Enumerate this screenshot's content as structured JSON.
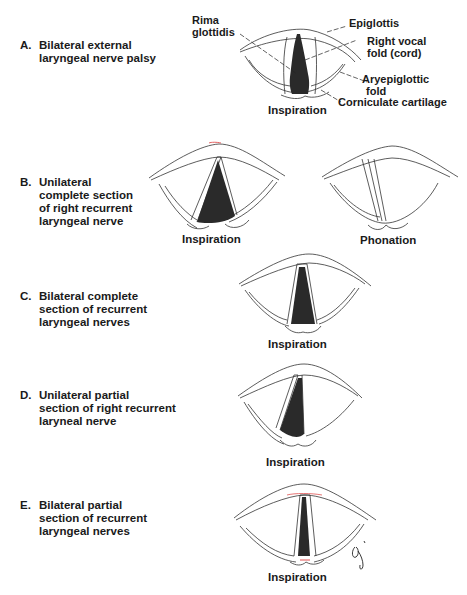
{
  "panels": [
    {
      "letter": "A.",
      "lines": [
        "Bilateral external",
        "laryngeal nerve palsy"
      ],
      "captions": [
        "Inspiration"
      ],
      "annotations": {
        "rima": [
          "Rima",
          "glottidis"
        ],
        "epiglottis": [
          "Epiglottis"
        ],
        "vocal_fold": [
          "Right vocal",
          "fold (cord)"
        ],
        "aryepiglottic": [
          "Aryepiglottic",
          "fold"
        ],
        "corniculate": [
          "Corniculate cartilage"
        ]
      }
    },
    {
      "letter": "B.",
      "lines": [
        "Unilateral",
        "complete section",
        "of right recurrent",
        "laryngeal nerve"
      ],
      "captions": [
        "Inspiration",
        "Phonation"
      ]
    },
    {
      "letter": "C.",
      "lines": [
        "Bilateral complete",
        "section of recurrent",
        "laryngeal nerves"
      ],
      "captions": [
        "Inspiration"
      ]
    },
    {
      "letter": "D.",
      "lines": [
        "Unilateral partial",
        "section of right recurrent",
        "laryneal nerve"
      ],
      "captions": [
        "Inspiration"
      ]
    },
    {
      "letter": "E.",
      "lines": [
        "Bilateral partial",
        "section of recurrent",
        "laryngeal nerves"
      ],
      "captions": [
        "Inspiration"
      ]
    }
  ],
  "signature": "oj",
  "colors": {
    "ink": "#1a1a1a",
    "shade": "#2a2a2a",
    "accent_red": "#e05050"
  }
}
